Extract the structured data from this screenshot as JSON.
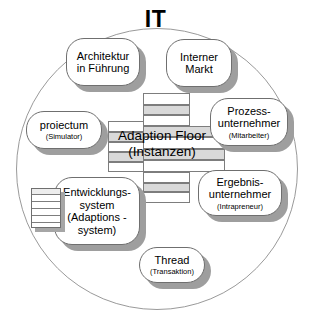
{
  "diagram": {
    "title": "IT",
    "container_shape": "circle",
    "center": {
      "label_line1": "Adaption Floor",
      "label_line2": "(Instanzen)",
      "name": "adaption-floor",
      "structure": "layered-stack"
    },
    "nodes": [
      {
        "id": "architektur",
        "title": "Architektur",
        "title2": "in Führung",
        "sub": ""
      },
      {
        "id": "interner-markt",
        "title": "Interner",
        "title2": "Markt",
        "sub": ""
      },
      {
        "id": "prozess",
        "title": "Prozess-",
        "title2": "unternehmer",
        "sub": "(Mitarbeiter)"
      },
      {
        "id": "ergebnis",
        "title": "Ergebnis-",
        "title2": "unternehmer",
        "sub": "(Intrapreneur)"
      },
      {
        "id": "thread",
        "title": "Thread",
        "title2": "",
        "sub": "(Transaktion)"
      },
      {
        "id": "entwicklung",
        "title": "Entwicklungs-",
        "title2": "system",
        "sub": "(Adaptions -system)"
      },
      {
        "id": "proiectum",
        "title": "proiectum",
        "title2": "",
        "sub": "(Simulator)"
      }
    ],
    "icons": [
      {
        "id": "stacked-sheets",
        "name": "stacked-sheets-icon"
      }
    ],
    "colors": {
      "outline": "#6f6f6f",
      "circle_outline": "#9a9a9a",
      "shadow": "#9e9e9e",
      "band_gray": "#d9d9d9",
      "band_white": "#ffffff",
      "text": "#000000"
    }
  }
}
